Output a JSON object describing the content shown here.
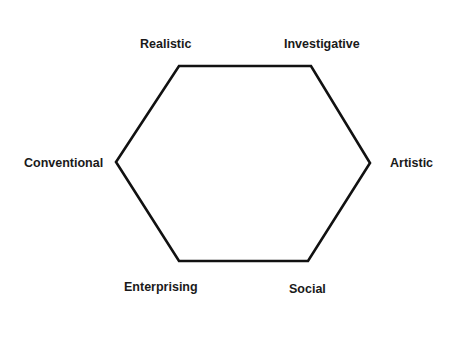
{
  "diagram": {
    "type": "hexagon",
    "stroke_color": "#111111",
    "vertices": [
      {
        "id": "realistic",
        "x": 179,
        "y": 66
      },
      {
        "id": "investigative",
        "x": 311,
        "y": 66
      },
      {
        "id": "artistic",
        "x": 370,
        "y": 163
      },
      {
        "id": "social",
        "x": 308,
        "y": 261
      },
      {
        "id": "enterprising",
        "x": 179,
        "y": 261
      },
      {
        "id": "conventional",
        "x": 116,
        "y": 162
      }
    ],
    "labels": {
      "realistic": "Realistic",
      "investigative": "Investigative",
      "artistic": "Artistic",
      "social": "Social",
      "enterprising": "Enterprising",
      "conventional": "Conventional"
    }
  }
}
